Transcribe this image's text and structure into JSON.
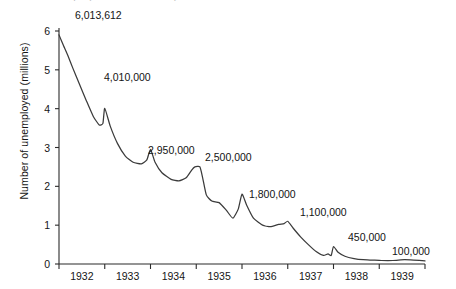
{
  "figure": {
    "clipped_title_fragment": "Unemployment in Germany 1932-1939",
    "y_axis_label": "Number of unemployed (millions)"
  },
  "chart_data": {
    "type": "line",
    "title": "",
    "xlabel": "",
    "ylabel": "Number of unemployed (millions)",
    "xlim": [
      1932,
      1940
    ],
    "ylim": [
      0,
      6
    ],
    "yticks": [
      "0",
      "1",
      "2",
      "3",
      "4",
      "5",
      "6"
    ],
    "ytick_values": [
      0,
      1,
      2,
      3,
      4,
      5,
      6
    ],
    "categories": [
      "1932",
      "1933",
      "1934",
      "1935",
      "1936",
      "1937",
      "1938",
      "1939"
    ],
    "grid": false,
    "legend": null,
    "series": [
      {
        "name": "Number of unemployed (millions)",
        "units": "millions",
        "points": [
          {
            "x": 1932.0,
            "y": 5.9
          },
          {
            "x": 1932.1,
            "y": 5.62
          },
          {
            "x": 1932.2,
            "y": 5.35
          },
          {
            "x": 1932.3,
            "y": 5.05
          },
          {
            "x": 1932.45,
            "y": 4.62
          },
          {
            "x": 1932.6,
            "y": 4.2
          },
          {
            "x": 1932.75,
            "y": 3.8
          },
          {
            "x": 1932.88,
            "y": 3.58
          },
          {
            "x": 1932.96,
            "y": 3.62
          },
          {
            "x": 1933.0,
            "y": 4.01
          },
          {
            "x": 1933.12,
            "y": 3.55
          },
          {
            "x": 1933.28,
            "y": 3.1
          },
          {
            "x": 1933.45,
            "y": 2.78
          },
          {
            "x": 1933.62,
            "y": 2.62
          },
          {
            "x": 1933.8,
            "y": 2.58
          },
          {
            "x": 1933.92,
            "y": 2.68
          },
          {
            "x": 1934.0,
            "y": 2.95
          },
          {
            "x": 1934.1,
            "y": 2.62
          },
          {
            "x": 1934.25,
            "y": 2.35
          },
          {
            "x": 1934.45,
            "y": 2.18
          },
          {
            "x": 1934.62,
            "y": 2.14
          },
          {
            "x": 1934.78,
            "y": 2.22
          },
          {
            "x": 1934.9,
            "y": 2.42
          },
          {
            "x": 1934.97,
            "y": 2.5
          },
          {
            "x": 1935.08,
            "y": 2.5
          },
          {
            "x": 1935.14,
            "y": 2.22
          },
          {
            "x": 1935.22,
            "y": 1.78
          },
          {
            "x": 1935.34,
            "y": 1.62
          },
          {
            "x": 1935.5,
            "y": 1.58
          },
          {
            "x": 1935.66,
            "y": 1.38
          },
          {
            "x": 1935.8,
            "y": 1.18
          },
          {
            "x": 1935.92,
            "y": 1.42
          },
          {
            "x": 1936.0,
            "y": 1.8
          },
          {
            "x": 1936.1,
            "y": 1.52
          },
          {
            "x": 1936.25,
            "y": 1.18
          },
          {
            "x": 1936.45,
            "y": 1.0
          },
          {
            "x": 1936.62,
            "y": 0.96
          },
          {
            "x": 1936.8,
            "y": 1.02
          },
          {
            "x": 1936.92,
            "y": 1.04
          },
          {
            "x": 1937.0,
            "y": 1.1
          },
          {
            "x": 1937.12,
            "y": 0.92
          },
          {
            "x": 1937.28,
            "y": 0.7
          },
          {
            "x": 1937.45,
            "y": 0.5
          },
          {
            "x": 1937.62,
            "y": 0.32
          },
          {
            "x": 1937.78,
            "y": 0.22
          },
          {
            "x": 1937.88,
            "y": 0.26
          },
          {
            "x": 1937.95,
            "y": 0.22
          },
          {
            "x": 1938.0,
            "y": 0.45
          },
          {
            "x": 1938.1,
            "y": 0.3
          },
          {
            "x": 1938.25,
            "y": 0.2
          },
          {
            "x": 1938.45,
            "y": 0.14
          },
          {
            "x": 1938.65,
            "y": 0.11
          },
          {
            "x": 1938.85,
            "y": 0.1
          },
          {
            "x": 1939.05,
            "y": 0.09
          },
          {
            "x": 1939.3,
            "y": 0.09
          },
          {
            "x": 1939.55,
            "y": 0.11
          },
          {
            "x": 1939.75,
            "y": 0.1
          },
          {
            "x": 1940.0,
            "y": 0.08
          }
        ]
      }
    ],
    "annotations": [
      {
        "label": "6,013,612",
        "value": 6013612,
        "x": 1932.0,
        "lx": 75,
        "ly": 10
      },
      {
        "label": "4,010,000",
        "value": 4010000,
        "x": 1933.0,
        "lx": 104,
        "ly": 72
      },
      {
        "label": "2,950,000",
        "value": 2950000,
        "x": 1934.0,
        "lx": 148,
        "ly": 145
      },
      {
        "label": "2,500,000",
        "value": 2500000,
        "x": 1935.0,
        "lx": 205,
        "ly": 152
      },
      {
        "label": "1,800,000",
        "value": 1800000,
        "x": 1936.0,
        "lx": 249,
        "ly": 189
      },
      {
        "label": "1,100,000",
        "value": 1100000,
        "x": 1937.0,
        "lx": 300,
        "ly": 207
      },
      {
        "label": "450,000",
        "value": 450000,
        "x": 1938.0,
        "lx": 348,
        "ly": 232
      },
      {
        "label": "100,000",
        "value": 100000,
        "x": 1939.4,
        "lx": 392,
        "ly": 246
      }
    ]
  },
  "axes": {
    "y_ticks": [
      {
        "label": "6",
        "value": 6
      },
      {
        "label": "5",
        "value": 5
      },
      {
        "label": "4",
        "value": 4
      },
      {
        "label": "3",
        "value": 3
      },
      {
        "label": "2",
        "value": 2
      },
      {
        "label": "1",
        "value": 1
      },
      {
        "label": "0",
        "value": 0
      }
    ],
    "x_ticks": [
      {
        "label": "1932"
      },
      {
        "label": "1933"
      },
      {
        "label": "1934"
      },
      {
        "label": "1935"
      },
      {
        "label": "1936"
      },
      {
        "label": "1937"
      },
      {
        "label": "1938"
      },
      {
        "label": "1939"
      }
    ]
  },
  "style": {
    "line_color": "#3b3b3b",
    "axis_color": "#2b2b2b",
    "text_color": "#141414",
    "background": "#ffffff"
  }
}
